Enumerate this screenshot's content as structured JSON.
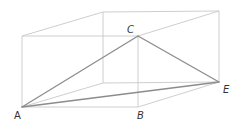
{
  "diagram": {
    "type": "cuboid-with-triangle",
    "colors": {
      "box_edge": "#c8c8c8",
      "triangle_edge": "#8c8c8c",
      "label": "#333333",
      "background": "#ffffff"
    },
    "vertices": {
      "A": {
        "x": 22,
        "y": 107
      },
      "B": {
        "x": 138,
        "y": 107
      },
      "C": {
        "x": 138,
        "y": 36
      },
      "E": {
        "x": 219,
        "y": 82
      },
      "front_top_left": {
        "x": 22,
        "y": 36
      },
      "back_top_left": {
        "x": 103,
        "y": 12
      },
      "back_top_right": {
        "x": 219,
        "y": 11
      },
      "back_bottom_left": {
        "x": 103,
        "y": 83
      }
    },
    "box_edges": [
      [
        "A",
        "B"
      ],
      [
        "A",
        "front_top_left"
      ],
      [
        "front_top_left",
        "C"
      ],
      [
        "B",
        "C"
      ],
      [
        "front_top_left",
        "back_top_left"
      ],
      [
        "back_top_left",
        "back_top_right"
      ],
      [
        "C",
        "back_top_right"
      ],
      [
        "back_top_right",
        "E"
      ],
      [
        "B",
        "E"
      ],
      [
        "A",
        "back_bottom_left"
      ],
      [
        "back_top_left",
        "back_bottom_left"
      ],
      [
        "back_bottom_left",
        "E"
      ]
    ],
    "triangle_edges": [
      [
        "A",
        "C"
      ],
      [
        "C",
        "E"
      ],
      [
        "A",
        "E"
      ]
    ],
    "labels": {
      "A": "A",
      "B": "B",
      "C": "C",
      "E": "E"
    }
  }
}
